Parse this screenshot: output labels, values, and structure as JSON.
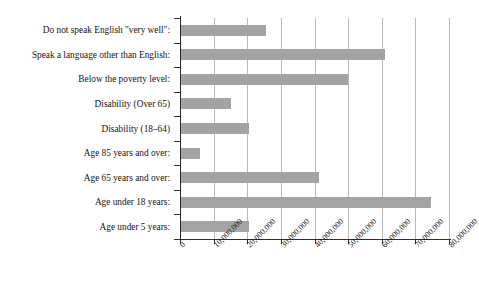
{
  "chart_data": {
    "type": "bar",
    "orientation": "horizontal",
    "title": "",
    "subtitle": "",
    "xlabel": "",
    "ylabel": "",
    "xlim": [
      0,
      80000000
    ],
    "ylim": null,
    "grid": true,
    "legend": null,
    "legend_position": "none",
    "bar_color": "#a3a3a3",
    "axis_color": "#2b2b2b",
    "grid_color": "#b9b9b9",
    "xticks": [
      0,
      10000000,
      20000000,
      30000000,
      40000000,
      50000000,
      60000000,
      70000000,
      80000000
    ],
    "xticklabels": [
      "0",
      "10,000,000",
      "20,000,000",
      "30,000,000",
      "40,000,000",
      "50,000,000",
      "60,000,000",
      "70,000,000",
      "80,000,000"
    ],
    "categories": [
      "Do not speak English \"very well\":",
      "Speak a language other than English:",
      "Below the poverty level:",
      "Disability (Over 65)",
      "Disability (18–64)",
      "Age 85 years and over:",
      "Age 65 years and over:",
      "Age under 18 years:",
      "Age under 5 years:"
    ],
    "values": [
      25300000,
      60700000,
      49700000,
      14900000,
      20200000,
      5700000,
      41000000,
      74400000,
      20300000
    ]
  }
}
